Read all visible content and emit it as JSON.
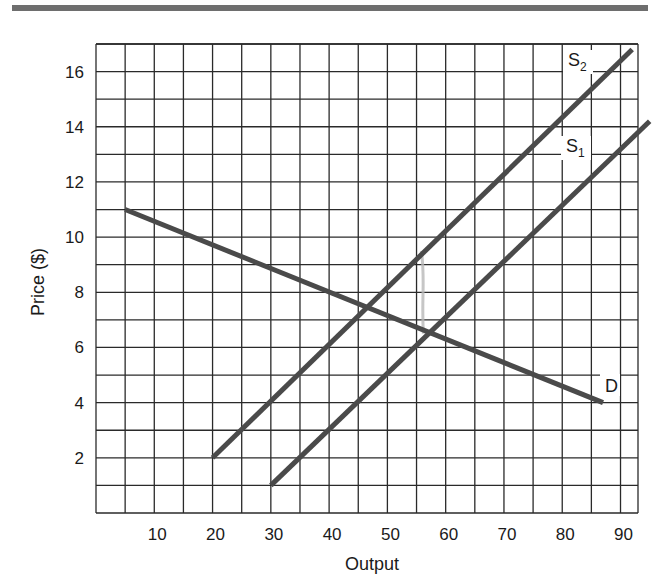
{
  "chart_data": {
    "type": "line",
    "title": "",
    "xlabel": "Output",
    "ylabel": "Price ($)",
    "xlim": [
      0,
      93
    ],
    "ylim": [
      0,
      17
    ],
    "grid": true,
    "grid_x_step": 5,
    "grid_y_step": 1,
    "x_ticks": [
      10,
      20,
      30,
      40,
      50,
      60,
      70,
      80,
      90
    ],
    "y_ticks": [
      2,
      4,
      6,
      8,
      10,
      12,
      14,
      16
    ],
    "series": [
      {
        "name": "D",
        "label": "D",
        "points": [
          [
            5,
            11
          ],
          [
            87,
            4
          ]
        ]
      },
      {
        "name": "S1",
        "label": "S",
        "subscript": "1",
        "points": [
          [
            30,
            1
          ],
          [
            95,
            14.2
          ]
        ]
      },
      {
        "name": "S2",
        "label": "S",
        "subscript": "2",
        "points": [
          [
            20,
            2
          ],
          [
            92,
            16.8
          ]
        ]
      }
    ],
    "annotations": [
      {
        "type": "equilibrium",
        "between": [
          "S2",
          "D"
        ],
        "x": 46,
        "y": 7.4
      },
      {
        "type": "equilibrium",
        "between": [
          "S1",
          "D"
        ],
        "x": 56,
        "y": 6.5
      },
      {
        "type": "pencil-mark",
        "description": "faint gray vertical mark",
        "x": 56,
        "y_from": 6.5,
        "y_to": 9.5
      }
    ],
    "legend": "none (curves labeled inline)"
  },
  "labels": {
    "x_axis": "Output",
    "y_axis": "Price ($)",
    "x_ticks": [
      "10",
      "20",
      "30",
      "40",
      "50",
      "60",
      "70",
      "80",
      "90"
    ],
    "y_ticks": [
      "2",
      "4",
      "6",
      "8",
      "10",
      "12",
      "14",
      "16"
    ],
    "curve_d": "D",
    "curve_s1": "S",
    "curve_s1_sub": "1",
    "curve_s2": "S",
    "curve_s2_sub": "2"
  },
  "colors": {
    "curve": "#4a4a4a",
    "grid": "#2a2a2a",
    "rule": "#6e6e6e",
    "pencil": "#b8b8b8"
  }
}
